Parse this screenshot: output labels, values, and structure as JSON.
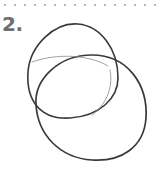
{
  "step": {
    "number": "2."
  },
  "sketch": {
    "description": "two overlapping hand-drawn oval shapes",
    "stroke_color": "#3a3a3a"
  }
}
